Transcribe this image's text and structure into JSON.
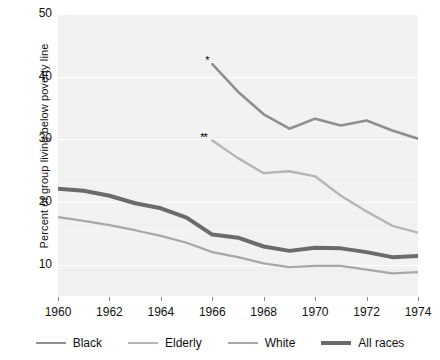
{
  "chart_data": {
    "type": "line",
    "title": "",
    "xlabel": "",
    "ylabel": "Percent of group living below poverty line",
    "xlim": [
      1960,
      1974
    ],
    "ylim": [
      5,
      50
    ],
    "xticks": [
      1960,
      1962,
      1964,
      1966,
      1968,
      1970,
      1972,
      1974
    ],
    "yticks": [
      10,
      20,
      30,
      40,
      50
    ],
    "grid": true,
    "legend_position": "bottom",
    "series": [
      {
        "name": "Black",
        "color": "#8f8f8f",
        "width": 2.6,
        "marker_note": "*",
        "x": [
          1966,
          1967,
          1968,
          1969,
          1970,
          1971,
          1972,
          1973,
          1974
        ],
        "values": [
          42.0,
          37.6,
          34.0,
          31.7,
          33.3,
          32.2,
          33.0,
          31.4,
          30.1
        ]
      },
      {
        "name": "Elderly",
        "color": "#b5b5b5",
        "width": 2.4,
        "marker_note": "**",
        "x": [
          1966,
          1967,
          1968,
          1969,
          1970,
          1971,
          1972,
          1973,
          1974
        ],
        "values": [
          29.8,
          27.0,
          24.6,
          24.9,
          24.1,
          21.0,
          18.5,
          16.2,
          15.1
        ]
      },
      {
        "name": "White",
        "color": "#a8a8a8",
        "width": 2.2,
        "marker_note": "",
        "x": [
          1960,
          1961,
          1962,
          1963,
          1964,
          1965,
          1966,
          1967,
          1968,
          1969,
          1970,
          1971,
          1972,
          1973,
          1974
        ],
        "values": [
          17.6,
          17.0,
          16.3,
          15.5,
          14.6,
          13.5,
          12.0,
          11.2,
          10.2,
          9.6,
          9.8,
          9.8,
          9.2,
          8.6,
          8.8
        ]
      },
      {
        "name": "All races",
        "color": "#6b6b6b",
        "width": 4.0,
        "marker_note": "",
        "x": [
          1960,
          1961,
          1962,
          1963,
          1964,
          1965,
          1966,
          1967,
          1968,
          1969,
          1970,
          1971,
          1972,
          1973,
          1974
        ],
        "values": [
          22.1,
          21.8,
          21.0,
          19.8,
          19.0,
          17.5,
          14.8,
          14.3,
          12.9,
          12.2,
          12.7,
          12.6,
          12.0,
          11.2,
          11.4
        ]
      }
    ],
    "annotations": [
      {
        "text": "*",
        "x": 1966,
        "y": 42.0,
        "series": "Black"
      },
      {
        "text": "**",
        "x": 1966,
        "y": 29.8,
        "series": "Elderly"
      }
    ]
  },
  "axis": {
    "ylabel": "Percent of group living below poverty line",
    "ytick_labels": [
      "50",
      "40",
      "30",
      "20",
      "10"
    ],
    "xtick_labels": [
      "1960",
      "1962",
      "1964",
      "1966",
      "1968",
      "1970",
      "1972",
      "1974"
    ]
  },
  "legend": {
    "items": [
      {
        "label": "Black",
        "color": "#8f8f8f",
        "thickness": "2.6px"
      },
      {
        "label": "Elderly",
        "color": "#b5b5b5",
        "thickness": "2.4px"
      },
      {
        "label": "White",
        "color": "#a8a8a8",
        "thickness": "2.2px"
      },
      {
        "label": "All races",
        "color": "#6b6b6b",
        "thickness": "4.2px"
      }
    ]
  },
  "style": {
    "plot_background": "#f2f2f2",
    "gridline_color": "#ffffff",
    "page_background": "#ffffff"
  }
}
